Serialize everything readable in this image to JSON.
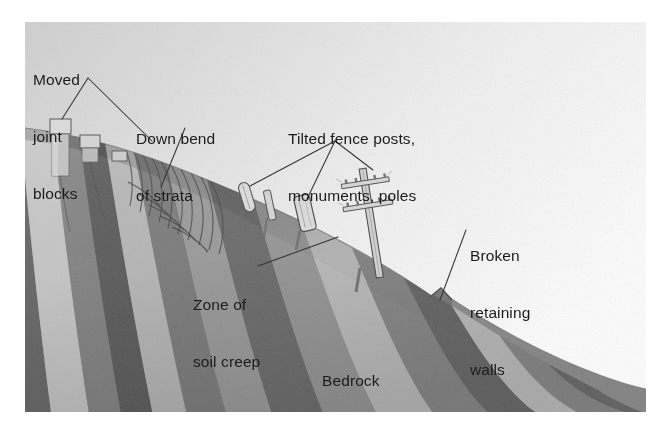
{
  "figure": {
    "panel": {
      "left": 25,
      "top": 22,
      "right": 646,
      "bottom": 412
    },
    "background_color": "#ffffff",
    "sky_color_light": "#fbfbfb",
    "sky_color_dark": "#d2d2d2",
    "text_color": "#1b1b1b",
    "leader_color": "#2a2a2a"
  },
  "labels": {
    "moved_joint_blocks": {
      "lines": [
        "Moved",
        "joint",
        "blocks"
      ]
    },
    "down_bend_of_strata": {
      "lines": [
        "Down bend",
        "of strata"
      ]
    },
    "tilted_fence_posts": {
      "lines": [
        "Tilted fence posts,",
        "monuments, poles"
      ]
    },
    "broken_retaining_walls": {
      "lines": [
        "Broken",
        "retaining",
        "walls"
      ]
    },
    "zone_of_soil_creep": {
      "lines": [
        "Zone of",
        "soil creep"
      ]
    },
    "bedrock": {
      "lines": [
        "Bedrock"
      ]
    }
  },
  "leaders": [
    {
      "name": "moved-joint-blocks-leader-a",
      "points": "88,78 62,128"
    },
    {
      "name": "moved-joint-blocks-leader-b",
      "points": "88,78 152,141"
    },
    {
      "name": "down-bend-leader",
      "points": "185,128 161,187"
    },
    {
      "name": "tilted-posts-leader-a",
      "points": "335,141 250,186"
    },
    {
      "name": "tilted-posts-leader-b",
      "points": "335,141 307,199"
    },
    {
      "name": "tilted-posts-leader-c",
      "points": "335,141 373,170"
    },
    {
      "name": "zone-of-soil-creep-leader",
      "points": "258,266 338,237"
    },
    {
      "name": "broken-walls-leader",
      "points": "466,230 440,300"
    }
  ],
  "strata": [
    {
      "name": "band-1",
      "tone": "#6d6d6d"
    },
    {
      "name": "band-2",
      "tone": "#c9c9c9"
    },
    {
      "name": "band-3",
      "tone": "#8a8a8a"
    },
    {
      "name": "band-4",
      "tone": "#5d5d5d"
    },
    {
      "name": "band-5",
      "tone": "#b4b4b4"
    },
    {
      "name": "band-6",
      "tone": "#7e7e7e"
    },
    {
      "name": "band-7",
      "tone": "#9b9b9b"
    },
    {
      "name": "band-8",
      "tone": "#6a6a6a"
    },
    {
      "name": "band-9",
      "tone": "#bdbdbd"
    },
    {
      "name": "band-10",
      "tone": "#8f8f8f"
    },
    {
      "name": "band-11",
      "tone": "#707070"
    },
    {
      "name": "band-12",
      "tone": "#a8a8a8"
    }
  ],
  "features": {
    "joint_blocks": [
      {
        "name": "joint-block-1",
        "x": 56,
        "y": 120
      },
      {
        "name": "joint-block-2",
        "x": 86,
        "y": 136
      },
      {
        "name": "joint-block-3",
        "x": 117,
        "y": 152
      }
    ],
    "fence_posts": [
      {
        "name": "fence-post-1",
        "x": 247,
        "y": 186
      },
      {
        "name": "fence-post-2",
        "x": 270,
        "y": 194
      }
    ],
    "monument": {
      "name": "monument-block",
      "x": 305,
      "y": 200
    },
    "utility_pole": {
      "name": "utility-pole",
      "x": 372,
      "y": 172,
      "crossarms": 2
    },
    "retaining_wall_notch": {
      "name": "retaining-wall-break",
      "x": 440,
      "y": 300
    }
  }
}
